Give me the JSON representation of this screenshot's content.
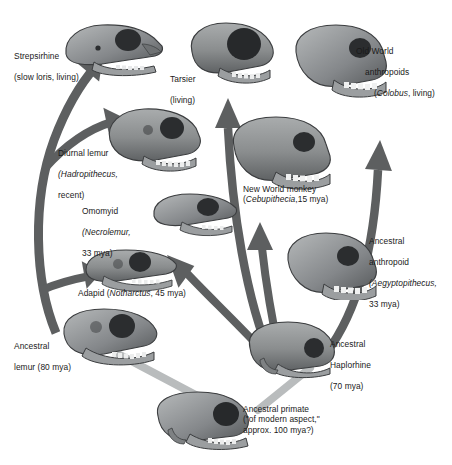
{
  "figure": {
    "type": "diagram",
    "background": "#ffffff",
    "colors": {
      "arrow_dark": "#5d5f60",
      "arrow_light": "#b9bcbd",
      "skull_mid": "#8c8f90",
      "skull_dark": "#4a4d4f",
      "skull_light": "#c2c5c6",
      "text": "#1a1a1a"
    }
  },
  "labels": {
    "strepsirhine": {
      "line1": "Strepsirhine",
      "line2": "(slow loris, living)"
    },
    "diurnal_lemur": {
      "line1": "Diurnal lemur",
      "line2_italic": "(Hadropithecus,",
      "line3": "recent)"
    },
    "omomyid": {
      "line1": "Omomyid",
      "line2_italic": "(Necrolemur,",
      "line3": "33 mya)"
    },
    "adapid": {
      "pre": "Adapid (",
      "italic": "Notharctus",
      "post": ", 45 mya)"
    },
    "ancestral_lemur": {
      "line1": "Ancestral",
      "line2": "lemur (80 mya)"
    },
    "tarsier": {
      "line1": "Tarsier",
      "line2": "(living)"
    },
    "old_world": {
      "line1": "Old World",
      "line2": "anthropoids",
      "line3_pre": "(",
      "line3_italic": "Colobus",
      "line3_post": ", living)"
    },
    "new_world": {
      "line1": "New World monkey",
      "line2_pre": "(",
      "line2_italic": "Cebupithecia",
      "line2_post": ",15 mya)"
    },
    "ancestral_anthropoid": {
      "line1": "Ancestral",
      "line2": "anthropoid",
      "line3_italic": "(Aegyptopithecus,",
      "line4": "33 mya)"
    },
    "ancestral_haplorhine": {
      "line1": "Ancestral",
      "line2": "Haplorhine",
      "line3": "(70 mya)"
    },
    "ancestral_primate": {
      "line1": "Ancestral primate",
      "line2": "(\"of modern aspect,\"",
      "line3": "approx. 100 mya?)"
    }
  },
  "nodes": [
    {
      "id": "strepsirhine",
      "name": "Strepsirhine",
      "age": "living",
      "taxon": "slow loris"
    },
    {
      "id": "diurnal-lemur",
      "name": "Diurnal lemur",
      "age": "recent",
      "taxon": "Hadropithecus"
    },
    {
      "id": "omomyid",
      "name": "Omomyid",
      "age": "33 mya",
      "taxon": "Necrolemur"
    },
    {
      "id": "adapid",
      "name": "Adapid",
      "age": "45 mya",
      "taxon": "Notharctus"
    },
    {
      "id": "ancestral-lemur",
      "name": "Ancestral lemur",
      "age": "80 mya",
      "taxon": ""
    },
    {
      "id": "tarsier",
      "name": "Tarsier",
      "age": "living",
      "taxon": ""
    },
    {
      "id": "old-world-anthropoids",
      "name": "Old World anthropoids",
      "age": "living",
      "taxon": "Colobus"
    },
    {
      "id": "new-world-monkey",
      "name": "New World monkey",
      "age": "15 mya",
      "taxon": "Cebupithecia"
    },
    {
      "id": "ancestral-anthropoid",
      "name": "Ancestral anthropoid",
      "age": "33 mya",
      "taxon": "Aegyptopithecus"
    },
    {
      "id": "ancestral-haplorhine",
      "name": "Ancestral Haplorhine",
      "age": "70 mya",
      "taxon": ""
    },
    {
      "id": "ancestral-primate",
      "name": "Ancestral primate",
      "age": "approx. 100 mya?",
      "taxon": "of modern aspect"
    }
  ],
  "edges": [
    {
      "from": "ancestral-primate",
      "to": "ancestral-lemur",
      "style": "light"
    },
    {
      "from": "ancestral-primate",
      "to": "ancestral-haplorhine",
      "style": "light"
    },
    {
      "from": "ancestral-lemur",
      "to": "strepsirhine",
      "style": "dark"
    },
    {
      "from": "ancestral-lemur",
      "to": "diurnal-lemur",
      "style": "dark"
    },
    {
      "from": "ancestral-lemur",
      "to": "adapid",
      "style": "dark"
    },
    {
      "from": "ancestral-haplorhine",
      "to": "tarsier",
      "style": "dark"
    },
    {
      "from": "ancestral-haplorhine",
      "to": "new-world-monkey",
      "style": "dark"
    },
    {
      "from": "ancestral-haplorhine",
      "to": "old-world-anthropoids",
      "style": "dark"
    },
    {
      "from": "ancestral-haplorhine",
      "to": "omomyid",
      "style": "dark"
    }
  ]
}
